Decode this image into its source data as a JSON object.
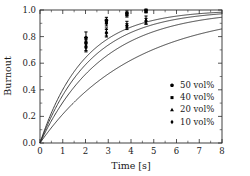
{
  "chart_data": {
    "type": "line",
    "title": "",
    "xlabel": "Time [s]",
    "ylabel": "Burnout",
    "xlim": [
      0,
      8
    ],
    "ylim": [
      0.0,
      1.0
    ],
    "xticks": [
      0,
      1,
      2,
      3,
      4,
      5,
      6,
      7,
      8
    ],
    "xtick_labels": [
      "0",
      "1",
      "2",
      "3",
      "4",
      "5",
      "6",
      "7",
      "8"
    ],
    "yticks": [
      0.0,
      0.2,
      0.4,
      0.6,
      0.8,
      1.0
    ],
    "ytick_labels": [
      "0.0",
      "0.2",
      "0.4",
      "0.6",
      "0.8",
      "1.0"
    ],
    "grid": false,
    "legend_position": "lower-right",
    "series": [
      {
        "name": "50 vol%",
        "marker": "pentagon",
        "time_constant": 1.95,
        "points": [
          {
            "x": 2.02,
            "y": 0.79,
            "yerr": 0.045
          },
          {
            "x": 2.92,
            "y": 0.92,
            "yerr": 0.025
          },
          {
            "x": 3.82,
            "y": 0.975,
            "yerr": 0.018
          },
          {
            "x": 4.66,
            "y": 0.995,
            "yerr": 0.012
          }
        ]
      },
      {
        "name": "40 vol%",
        "marker": "square",
        "time_constant": 2.25,
        "points": [
          {
            "x": 2.02,
            "y": 0.755,
            "yerr": 0.04
          },
          {
            "x": 2.92,
            "y": 0.905,
            "yerr": 0.025
          },
          {
            "x": 3.82,
            "y": 0.965,
            "yerr": 0.018
          },
          {
            "x": 4.66,
            "y": 0.99,
            "yerr": 0.012
          }
        ]
      },
      {
        "name": "20 vol%",
        "marker": "triangle",
        "time_constant": 2.75,
        "points": [
          {
            "x": 2.02,
            "y": 0.735,
            "yerr": 0.04
          },
          {
            "x": 2.92,
            "y": 0.835,
            "yerr": 0.03
          },
          {
            "x": 3.82,
            "y": 0.89,
            "yerr": 0.025
          },
          {
            "x": 4.66,
            "y": 0.925,
            "yerr": 0.03
          }
        ]
      },
      {
        "name": "10 vol%",
        "marker": "diamond",
        "time_constant": 4.1,
        "points": [
          {
            "x": 2.02,
            "y": 0.72,
            "yerr": 0.035
          },
          {
            "x": 2.92,
            "y": 0.825,
            "yerr": 0.028
          },
          {
            "x": 3.82,
            "y": 0.875,
            "yerr": 0.022
          },
          {
            "x": 4.66,
            "y": 0.915,
            "yerr": 0.022
          }
        ]
      }
    ]
  },
  "legend": {
    "entries": [
      {
        "label": "50 vol%",
        "marker": "pentagon"
      },
      {
        "label": "40 vol%",
        "marker": "square"
      },
      {
        "label": "20 vol%",
        "marker": "triangle"
      },
      {
        "label": "10 vol%",
        "marker": "diamond"
      }
    ]
  },
  "colors": {
    "line": "#2b2b2b",
    "marker": "#000000",
    "text": "#1a1a1a",
    "background": "#ffffff"
  }
}
